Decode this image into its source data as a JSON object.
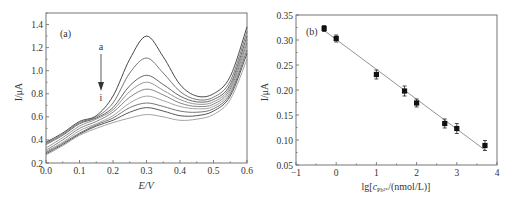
{
  "chart_data": [
    {
      "type": "line",
      "panel_label": "(a)",
      "title": "",
      "xlabel": "E/V",
      "ylabel": "I/μA",
      "xlim": [
        0.0,
        0.6
      ],
      "ylim": [
        0.2,
        1.5
      ],
      "xticks": [
        "0.0",
        "0.1",
        "0.2",
        "0.3",
        "0.4",
        "0.5",
        "0.6"
      ],
      "yticks": [
        "0.2",
        "0.4",
        "0.6",
        "0.8",
        "1.0",
        "1.2",
        "1.4"
      ],
      "grid": false,
      "annotation": {
        "start": "a",
        "end": "i",
        "arrow": "down",
        "x": 0.165
      },
      "x": [
        0.0,
        0.05,
        0.1,
        0.15,
        0.2,
        0.25,
        0.3,
        0.35,
        0.4,
        0.45,
        0.5,
        0.55,
        0.6
      ],
      "series": [
        {
          "name": "a",
          "values": [
            0.38,
            0.46,
            0.56,
            0.61,
            0.78,
            1.1,
            1.3,
            1.12,
            0.88,
            0.78,
            0.8,
            0.95,
            1.38
          ]
        },
        {
          "name": "b",
          "values": [
            0.37,
            0.45,
            0.55,
            0.6,
            0.72,
            0.98,
            1.11,
            0.98,
            0.82,
            0.75,
            0.77,
            0.91,
            1.34
          ]
        },
        {
          "name": "c",
          "values": [
            0.36,
            0.44,
            0.54,
            0.59,
            0.68,
            0.87,
            0.96,
            0.88,
            0.78,
            0.73,
            0.75,
            0.88,
            1.3
          ]
        },
        {
          "name": "d",
          "values": [
            0.33,
            0.42,
            0.52,
            0.58,
            0.66,
            0.82,
            0.9,
            0.83,
            0.75,
            0.71,
            0.73,
            0.86,
            1.27
          ]
        },
        {
          "name": "e",
          "values": [
            0.31,
            0.4,
            0.5,
            0.56,
            0.64,
            0.77,
            0.84,
            0.79,
            0.72,
            0.69,
            0.71,
            0.84,
            1.24
          ]
        },
        {
          "name": "f",
          "values": [
            0.3,
            0.38,
            0.48,
            0.54,
            0.61,
            0.72,
            0.78,
            0.74,
            0.69,
            0.67,
            0.69,
            0.82,
            1.21
          ]
        },
        {
          "name": "g",
          "values": [
            0.29,
            0.37,
            0.46,
            0.53,
            0.59,
            0.68,
            0.72,
            0.69,
            0.65,
            0.64,
            0.67,
            0.8,
            1.18
          ]
        },
        {
          "name": "h",
          "values": [
            0.28,
            0.36,
            0.45,
            0.52,
            0.57,
            0.64,
            0.68,
            0.65,
            0.61,
            0.61,
            0.65,
            0.78,
            1.15
          ]
        },
        {
          "name": "i",
          "values": [
            0.27,
            0.35,
            0.44,
            0.5,
            0.55,
            0.59,
            0.62,
            0.6,
            0.57,
            0.58,
            0.62,
            0.75,
            1.1
          ]
        }
      ]
    },
    {
      "type": "scatter",
      "panel_label": "(b)",
      "title": "",
      "xlabel": "lg[c_Pb2+/(nmol/L)]",
      "xlabel_main": "lg[",
      "xlabel_var": "c",
      "xlabel_sub": "Pb²⁺",
      "xlabel_tail": "/(nmol/L)]",
      "ylabel": "I/μA",
      "xlim": [
        -1,
        4
      ],
      "ylim": [
        0.05,
        0.35
      ],
      "xticks": [
        "−1",
        "0",
        "1",
        "2",
        "3",
        "4"
      ],
      "yticks": [
        "0.05",
        "0.10",
        "0.15",
        "0.20",
        "0.25",
        "0.30",
        "0.35"
      ],
      "grid": false,
      "x": [
        -0.3,
        0.0,
        1.0,
        1.7,
        2.0,
        2.7,
        3.0,
        3.7
      ],
      "values": [
        0.323,
        0.303,
        0.231,
        0.198,
        0.174,
        0.133,
        0.123,
        0.089
      ],
      "errors": [
        0.006,
        0.007,
        0.009,
        0.01,
        0.008,
        0.009,
        0.01,
        0.01
      ],
      "fit_line": {
        "x": [
          -0.3,
          3.7
        ],
        "y": [
          0.319,
          0.08
        ]
      }
    }
  ]
}
